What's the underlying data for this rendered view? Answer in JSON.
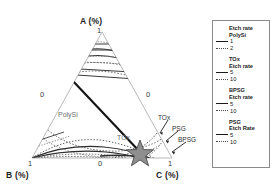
{
  "chart_data": {
    "type": "line",
    "title": "",
    "plot_kind": "ternary-contour",
    "axes": {
      "a": {
        "label": "A (%)",
        "min_tick": "0",
        "max_tick": "1"
      },
      "b": {
        "label": "B (%)",
        "min_tick": "0",
        "max_tick": "1"
      },
      "c": {
        "label": "C (%)",
        "min_tick": "0",
        "max_tick": "1"
      }
    },
    "tick_labels": {
      "apex_top": "1",
      "left_mid": "0",
      "right_mid": "0",
      "bottom_left": "1",
      "bottom_mid": "0",
      "bottom_right": "1"
    },
    "inline_labels": [
      "PolySi",
      "TOx"
    ],
    "annotations": [
      "TOx",
      "PSG",
      "BPSG"
    ],
    "marker": {
      "name": "optimum-star",
      "symbol": "star",
      "color": "#808080"
    },
    "series": [
      {
        "name": "Etch rate PolySi 1",
        "value": 1,
        "style": "solid",
        "color": "#1a1a1a"
      },
      {
        "name": "Etch rate PolySi 2",
        "value": 2,
        "style": "dotted",
        "color": "#4a4a4a"
      },
      {
        "name": "TOx Etch rate 5",
        "value": 5,
        "style": "solid",
        "color": "#1a1a1a"
      },
      {
        "name": "TOx Etch rate 10",
        "value": 10,
        "style": "dotted",
        "color": "#4a4a4a"
      },
      {
        "name": "BPSG Etch rate 5",
        "value": 5,
        "style": "solid",
        "color": "#1a1a1a"
      },
      {
        "name": "BPSG Etch rate 10",
        "value": 10,
        "style": "dotted",
        "color": "#4a4a4a"
      },
      {
        "name": "PSG Etch Rate 5",
        "value": 5,
        "style": "solid",
        "color": "#1a1a1a"
      },
      {
        "name": "PSG Etch Rate 10",
        "value": 10,
        "style": "dotted",
        "color": "#4a4a4a"
      }
    ],
    "legend_position": "right"
  },
  "plot": {
    "axis_a": "A (%)",
    "axis_b": "B (%)",
    "axis_c": "C (%)",
    "tick_apex": "1",
    "tick_left": "0",
    "tick_right": "0",
    "tick_bottom_left": "1",
    "tick_bottom_mid": "0",
    "tick_bottom_right": "1",
    "label_polysi": "PolySi",
    "label_tox_inner": "TOx",
    "annot_tox": "TOx",
    "annot_psg": "PSG",
    "annot_bpsg": "BPSG"
  },
  "legend": {
    "groups": [
      {
        "title_line1": "Etch rate",
        "title_line2": "PolySi",
        "rows": [
          {
            "style": "solid",
            "value": "1"
          },
          {
            "style": "dotted",
            "value": "2"
          }
        ]
      },
      {
        "title_line1": "TOx",
        "title_line2": "Etch rate",
        "rows": [
          {
            "style": "solid",
            "value": "5"
          },
          {
            "style": "dotted",
            "value": "10"
          }
        ]
      },
      {
        "title_line1": "BPSG",
        "title_line2": "Etch rate",
        "rows": [
          {
            "style": "solid",
            "value": "5"
          },
          {
            "style": "dotted",
            "value": "10"
          }
        ]
      },
      {
        "title_line1": "PSG",
        "title_line2": "Etch Rate",
        "rows": [
          {
            "style": "solid",
            "value": "5"
          },
          {
            "style": "dotted",
            "value": "10"
          }
        ]
      }
    ]
  }
}
